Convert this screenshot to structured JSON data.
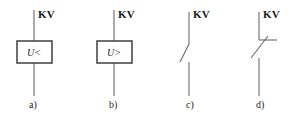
{
  "figure": {
    "width": 289,
    "height": 122,
    "background": "#ffffff",
    "line_color": "#6b6b6b",
    "box_stroke_color": "#4a4a4a",
    "text_color": "#1a1a1a"
  },
  "symbols": [
    {
      "id": "a",
      "caption": "a)",
      "terminal_label": "KV",
      "box_label": "U<",
      "type": "undervoltage-relay-box",
      "geometry": {
        "line_x": 34,
        "line_top_y": 10,
        "line_bottom_y": 96,
        "box_x": 17,
        "box_y": 41,
        "box_w": 35,
        "box_h": 22
      },
      "label_pos": {
        "kv_x": 38,
        "kv_y": 9,
        "caption_x": 29,
        "caption_y": 100
      }
    },
    {
      "id": "b",
      "caption": "b)",
      "terminal_label": "KV",
      "box_label": "U>",
      "type": "overvoltage-relay-box",
      "geometry": {
        "line_x": 114,
        "line_top_y": 10,
        "line_bottom_y": 96,
        "box_x": 97,
        "box_y": 41,
        "box_w": 35,
        "box_h": 22
      },
      "label_pos": {
        "kv_x": 118,
        "kv_y": 9,
        "caption_x": 109,
        "caption_y": 100
      }
    },
    {
      "id": "c",
      "caption": "c)",
      "terminal_label": "KV",
      "box_label": "",
      "type": "normally-open-contact",
      "geometry": {
        "line_x": 189,
        "line_top_y": 12,
        "line_bottom_y": 96,
        "upper_end_y": 44,
        "diagonal_x": 180,
        "diagonal_y": 62,
        "lower_start_y": 62
      },
      "label_pos": {
        "kv_x": 193,
        "kv_y": 9,
        "caption_x": 186,
        "caption_y": 100
      }
    },
    {
      "id": "d",
      "caption": "d)",
      "terminal_label": "KV",
      "box_label": "",
      "type": "normally-closed-contact",
      "geometry": {
        "line_x": 259,
        "line_top_y": 12,
        "line_bottom_y": 96,
        "upper_end_y": 40,
        "bar_x1": 259,
        "bar_x2": 277,
        "bar_y": 40,
        "diagonal_x": 251,
        "diagonal_y": 58,
        "lower_start_y": 58
      },
      "label_pos": {
        "kv_x": 263,
        "kv_y": 9,
        "caption_x": 256,
        "caption_y": 100
      }
    }
  ]
}
